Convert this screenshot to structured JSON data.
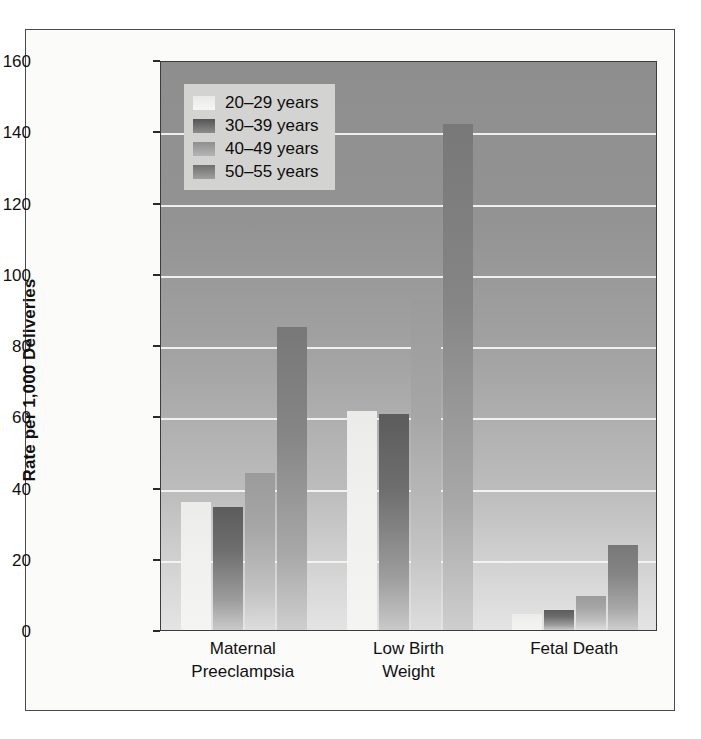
{
  "chart_data": {
    "type": "bar",
    "title": "",
    "xlabel": "",
    "ylabel": "Rate per 1,000 Deliveries",
    "ylim": [
      0,
      160
    ],
    "yticks": [
      0,
      20,
      40,
      60,
      80,
      100,
      120,
      140,
      160
    ],
    "grid": true,
    "legend_position": "top-left",
    "categories": [
      "Maternal\nPreeclampsia",
      "Low Birth\nWeight",
      "Fetal Death"
    ],
    "category_lines": [
      [
        "Maternal",
        "Preeclampsia"
      ],
      [
        "Low Birth",
        "Weight"
      ],
      [
        "Fetal Death",
        ""
      ]
    ],
    "series": [
      {
        "name": "20–29 years",
        "values": [
          36,
          61.5,
          4.5
        ]
      },
      {
        "name": "30–39 years",
        "values": [
          34.5,
          60.5,
          5.5
        ]
      },
      {
        "name": "40–49 years",
        "values": [
          44,
          92.5,
          9.5
        ]
      },
      {
        "name": "50–55 years",
        "values": [
          85,
          142,
          24
        ]
      }
    ]
  },
  "legend": {
    "items": [
      {
        "label": "20–29 years"
      },
      {
        "label": "30–39 years"
      },
      {
        "label": "40–49 years"
      },
      {
        "label": "50–55 years"
      }
    ]
  },
  "colors": {
    "plot_background_top": "#8e8e8e",
    "plot_background_bottom": "#e4e4e4",
    "gridline": "#f4f4f2",
    "axis": "#3c3c3c",
    "text": "#111111",
    "legend_background": "#d3d3d1",
    "figure_background": "#fbfbfa",
    "series_20_29": "#f0f0ee",
    "series_30_39": "#6e6e6e",
    "series_40_49": "#a6a6a6",
    "series_50_55": "#858585"
  }
}
